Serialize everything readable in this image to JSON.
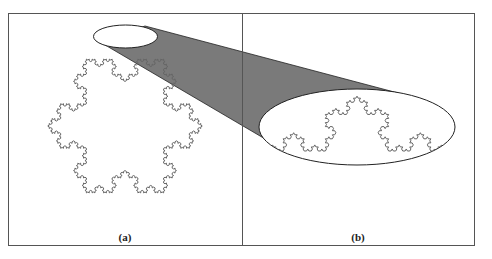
{
  "figure": {
    "panels": [
      {
        "id": "a",
        "label": "(a)",
        "content": "Koch snowflake with elliptical magnified region at top"
      },
      {
        "id": "b",
        "label": "(b)",
        "content": "Magnified view of Koch curve segment inside ellipse"
      }
    ],
    "colors": {
      "frame": "#555555",
      "cone_fill": "#7a7a7a",
      "curve": "#666666",
      "ellipse_stroke": "#222222"
    },
    "snowflake_iterations": 4,
    "magnified_iterations": 4
  }
}
